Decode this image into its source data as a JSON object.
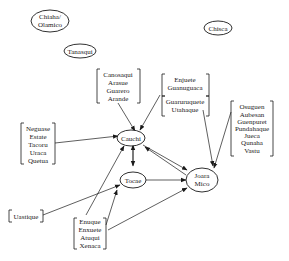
{
  "diagram": {
    "nodes": {
      "chiaha": {
        "lines": [
          "Chiaha/",
          "Olamico"
        ]
      },
      "tanasqui": {
        "lines": [
          "Tanasqui"
        ]
      },
      "chisca": {
        "lines": [
          "Chisca"
        ]
      },
      "cauchi": {
        "lines": [
          "Cauchi"
        ]
      },
      "tocae": {
        "lines": [
          "Tocae"
        ]
      },
      "joara": {
        "lines": [
          "Joara",
          "Mico"
        ]
      }
    },
    "groups": {
      "canosaqui": {
        "lines": [
          "Canosaqui",
          "Arasue",
          "Guarero",
          "Arande"
        ]
      },
      "enjuete": {
        "lines": [
          "Enjuete",
          "Guanuguaca"
        ]
      },
      "guaruruquete": {
        "lines": [
          "Guaruruquete",
          "Utahaque"
        ]
      },
      "neguase": {
        "lines": [
          "Neguase",
          "Estate",
          "Tacoru",
          "Uraca",
          "Quetua"
        ]
      },
      "osuguen": {
        "lines": [
          "Osuguen",
          "Aubesan",
          "Guenpuret",
          "Pundahaque",
          "Jueca",
          "Qunaha",
          "Vastu"
        ]
      },
      "uastique": {
        "lines": [
          "Uastique"
        ]
      },
      "enuque": {
        "lines": [
          "Enuque",
          "Enxuete",
          "Atuqui",
          "Xenaca"
        ]
      }
    },
    "edges": [
      {
        "from": "canosaqui",
        "to": "cauchi"
      },
      {
        "from": "enjuete",
        "to": "cauchi"
      },
      {
        "from": "guaruruquete",
        "to": "joara"
      },
      {
        "from": "neguase",
        "to": "cauchi"
      },
      {
        "from": "osuguen",
        "to": "joara"
      },
      {
        "from": "cauchi",
        "to": "tocae",
        "bidirectional": true
      },
      {
        "from": "cauchi",
        "to": "joara",
        "bidirectional": true
      },
      {
        "from": "tocae",
        "to": "joara"
      },
      {
        "from": "uastique",
        "to": "tocae"
      },
      {
        "from": "enuque",
        "to": "cauchi"
      },
      {
        "from": "enuque",
        "to": "tocae"
      },
      {
        "from": "enuque",
        "to": "joara"
      }
    ]
  }
}
